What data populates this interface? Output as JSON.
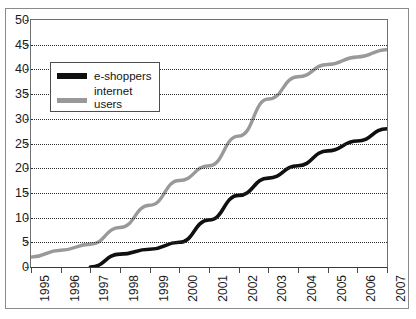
{
  "chart_data": {
    "type": "line",
    "title": "",
    "subtitle": "",
    "xlabel": "",
    "ylabel": "",
    "xlim": [
      1995,
      2007
    ],
    "ylim": [
      0,
      50
    ],
    "grid": true,
    "legend_position": "upper-left-inside",
    "x": [
      1995,
      1996,
      1997,
      1998,
      1999,
      2000,
      2001,
      2002,
      2003,
      2004,
      2005,
      2006,
      2007
    ],
    "xtick_labels": [
      "1995",
      "1996",
      "1997",
      "1998",
      "1999",
      "2000",
      "2001",
      "2002",
      "2003",
      "2004",
      "2005",
      "2006",
      "2007"
    ],
    "ytick_labels": [
      "0",
      "5",
      "10",
      "15",
      "20",
      "25",
      "30",
      "35",
      "40",
      "45",
      "50"
    ],
    "ytick_values": [
      0,
      5,
      10,
      15,
      20,
      25,
      30,
      35,
      40,
      45,
      50
    ],
    "series": [
      {
        "name": "e-shoppers",
        "color": "#101010",
        "values": [
          null,
          null,
          0,
          2.6,
          3.6,
          5.0,
          9.5,
          14.5,
          18.0,
          20.5,
          23.5,
          25.5,
          28.0
        ]
      },
      {
        "name": "internet\nusers",
        "color": "#999999",
        "values": [
          2.0,
          3.4,
          4.6,
          8.0,
          12.5,
          17.5,
          20.5,
          26.5,
          34.0,
          38.5,
          41.0,
          42.5,
          44.0
        ]
      }
    ]
  },
  "legend": {
    "entries": [
      {
        "label": "e-shoppers",
        "color": "#101010"
      },
      {
        "label": "internet\nusers",
        "color": "#999999"
      }
    ]
  }
}
